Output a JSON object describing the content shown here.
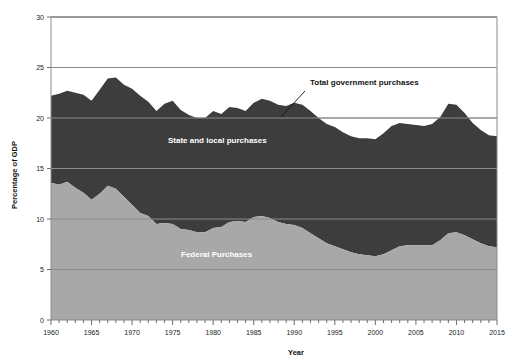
{
  "chart_data": {
    "type": "area",
    "stacked": true,
    "title": "",
    "xlabel": "Year",
    "ylabel": "Percentage of GDP",
    "xlim": [
      1960,
      2015
    ],
    "ylim": [
      0,
      30
    ],
    "ytick_values": [
      0,
      5,
      10,
      15,
      20,
      25,
      30
    ],
    "ytick_labels": [
      "0",
      "5",
      "10",
      "15",
      "20",
      "25",
      "30"
    ],
    "xtick_values": [
      1960,
      1965,
      1970,
      1975,
      1980,
      1985,
      1990,
      1995,
      2000,
      2005,
      2010,
      2015
    ],
    "xtick_labels": [
      "1960",
      "1965",
      "1970",
      "1975",
      "1980",
      "1985",
      "1990",
      "1995",
      "2000",
      "2005",
      "2010",
      "2015"
    ],
    "xtick_minor_step": 1,
    "grid": "horizontal-major-only",
    "legend_position": "inline-annotations",
    "x": [
      1960,
      1961,
      1962,
      1963,
      1964,
      1965,
      1966,
      1967,
      1968,
      1969,
      1970,
      1971,
      1972,
      1973,
      1974,
      1975,
      1976,
      1977,
      1978,
      1979,
      1980,
      1981,
      1982,
      1983,
      1984,
      1985,
      1986,
      1987,
      1988,
      1989,
      1990,
      1991,
      1992,
      1993,
      1994,
      1995,
      1996,
      1997,
      1998,
      1999,
      2000,
      2001,
      2002,
      2003,
      2004,
      2005,
      2006,
      2007,
      2008,
      2009,
      2010,
      2011,
      2012,
      2013,
      2014,
      2015
    ],
    "series": [
      {
        "name": "Federal Purchases",
        "color": "#a8a8a8",
        "values": [
          13.6,
          13.4,
          13.7,
          13.1,
          12.6,
          11.9,
          12.5,
          13.3,
          13.0,
          12.2,
          11.4,
          10.6,
          10.3,
          9.5,
          9.6,
          9.5,
          9.0,
          8.9,
          8.7,
          8.7,
          9.1,
          9.2,
          9.7,
          9.8,
          9.7,
          10.2,
          10.3,
          10.1,
          9.7,
          9.5,
          9.4,
          9.1,
          8.6,
          8.1,
          7.6,
          7.3,
          7.0,
          6.7,
          6.5,
          6.4,
          6.3,
          6.5,
          6.9,
          7.3,
          7.4,
          7.4,
          7.4,
          7.4,
          7.9,
          8.6,
          8.7,
          8.4,
          8.0,
          7.6,
          7.3,
          7.2
        ]
      },
      {
        "name": "State and local purchases",
        "color": "#3d3d3d",
        "values": [
          8.6,
          9.0,
          9.0,
          9.4,
          9.7,
          9.8,
          10.3,
          10.6,
          11.0,
          11.1,
          11.5,
          11.6,
          11.3,
          11.2,
          11.8,
          12.2,
          11.8,
          11.4,
          11.3,
          11.3,
          11.6,
          11.2,
          11.4,
          11.2,
          11.0,
          11.3,
          11.6,
          11.6,
          11.6,
          11.7,
          12.1,
          12.2,
          12.1,
          11.9,
          11.8,
          11.8,
          11.6,
          11.5,
          11.5,
          11.6,
          11.6,
          12.0,
          12.3,
          12.2,
          12.0,
          11.9,
          11.8,
          12.0,
          12.2,
          12.8,
          12.6,
          12.1,
          11.5,
          11.2,
          11.0,
          11.0
        ]
      }
    ],
    "total": {
      "name": "Total government purchases",
      "values": [
        22.2,
        22.4,
        22.7,
        22.5,
        22.3,
        21.7,
        22.8,
        23.9,
        24.0,
        23.3,
        22.9,
        22.2,
        21.6,
        20.7,
        21.4,
        21.7,
        20.8,
        20.3,
        20.0,
        20.0,
        20.7,
        20.4,
        21.1,
        21.0,
        20.7,
        21.5,
        21.9,
        21.7,
        21.3,
        21.2,
        21.5,
        21.3,
        20.7,
        20.0,
        19.4,
        19.1,
        18.6,
        18.2,
        18.0,
        18.0,
        17.9,
        18.5,
        19.2,
        19.5,
        19.4,
        19.3,
        19.2,
        19.4,
        20.1,
        21.4,
        21.3,
        20.5,
        19.5,
        18.8,
        18.3,
        18.2
      ]
    },
    "annotations": [
      {
        "id": "total-government-purchases",
        "text": "Total government purchases",
        "text_x_px": 310,
        "text_y_px": 85,
        "leader_from_px": [
          305,
          91
        ],
        "leader_to_px": [
          281,
          117
        ]
      },
      {
        "id": "state-and-local-purchases",
        "text": "State and local purchases",
        "text_x_px": 168,
        "text_y_px": 143
      },
      {
        "id": "federal-purchases",
        "text": "Federal Purchases",
        "text_x_px": 181,
        "text_y_px": 257
      }
    ],
    "colors": {
      "federal": "#a8a8a8",
      "state_local": "#3d3d3d",
      "axis": "#8b8b8b",
      "text": "#111111",
      "background": "#ffffff"
    },
    "plot_area_px": {
      "left": 51,
      "right": 497,
      "top": 17,
      "bottom": 320
    }
  }
}
